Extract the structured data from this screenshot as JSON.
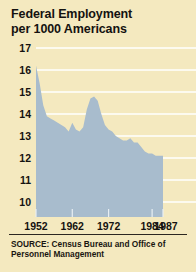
{
  "figure": {
    "title_line1": "Federal Employment",
    "title_line2": "per 1000 Americans",
    "source_line1": "SOURCE: Census Bureau and Office of",
    "source_line2": "Personnel Management",
    "background_color": "#f4e9bf",
    "area_color": "#a8bccd",
    "gridline_color": "#ffffff",
    "text_color": "#141210"
  },
  "chart_data": {
    "type": "area",
    "title": "Federal Employment per 1000 Americans",
    "xlabel": "",
    "ylabel": "Federal employees per 1000 Americans",
    "ylim": [
      9.4,
      17.4
    ],
    "xlim": [
      1952,
      1987
    ],
    "grid": true,
    "legend": "none",
    "ytick_labels": [
      "17",
      "16",
      "15",
      "14",
      "13",
      "12",
      "11",
      "10"
    ],
    "ytick_values": [
      17,
      16,
      15,
      14,
      13,
      12,
      11,
      10
    ],
    "xtick_labels": [
      "1952",
      "1962",
      "1972",
      "1984",
      "1987"
    ],
    "xtick_values": [
      1952,
      1962,
      1972,
      1984,
      1987
    ],
    "x": [
      1952,
      1953,
      1954,
      1955,
      1956,
      1957,
      1958,
      1959,
      1960,
      1961,
      1962,
      1963,
      1964,
      1965,
      1966,
      1967,
      1968,
      1969,
      1970,
      1971,
      1972,
      1973,
      1974,
      1975,
      1976,
      1977,
      1978,
      1979,
      1980,
      1981,
      1982,
      1983,
      1984,
      1985,
      1986,
      1987
    ],
    "values": [
      16.2,
      15.4,
      14.4,
      13.9,
      13.8,
      13.7,
      13.6,
      13.5,
      13.4,
      13.2,
      13.6,
      13.3,
      13.2,
      13.4,
      14.2,
      14.7,
      14.8,
      14.6,
      14.0,
      13.5,
      13.3,
      13.2,
      13.0,
      12.9,
      12.8,
      12.8,
      12.9,
      12.7,
      12.7,
      12.5,
      12.3,
      12.2,
      12.2,
      12.1,
      12.1,
      12.1
    ],
    "series": [
      {
        "name": "Federal employment per 1000 Americans",
        "values": [
          16.2,
          15.4,
          14.4,
          13.9,
          13.8,
          13.7,
          13.6,
          13.5,
          13.4,
          13.2,
          13.6,
          13.3,
          13.2,
          13.4,
          14.2,
          14.7,
          14.8,
          14.6,
          14.0,
          13.5,
          13.3,
          13.2,
          13.0,
          12.9,
          12.8,
          12.8,
          12.9,
          12.7,
          12.7,
          12.5,
          12.3,
          12.2,
          12.2,
          12.1,
          12.1,
          12.1
        ]
      }
    ],
    "annotations": []
  }
}
